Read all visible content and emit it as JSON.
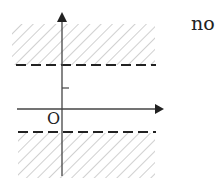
{
  "diagram": {
    "type": "coordinate-plane-region",
    "answer_label": "no",
    "origin_label": "O",
    "axes": {
      "x_arrow": true,
      "y_arrow": true
    },
    "boundaries": [
      {
        "kind": "dashed-horizontal",
        "position": "above x-axis"
      },
      {
        "kind": "dashed-horizontal",
        "position": "below x-axis"
      }
    ],
    "shaded_regions": [
      "above upper dashed line",
      "below lower dashed line"
    ],
    "tick_marks": [
      {
        "axis": "y",
        "position": "between x-axis and upper dashed line"
      }
    ],
    "colors": {
      "ink": "#222222",
      "hatch": "#b0b0b0",
      "background": "#ffffff"
    }
  }
}
